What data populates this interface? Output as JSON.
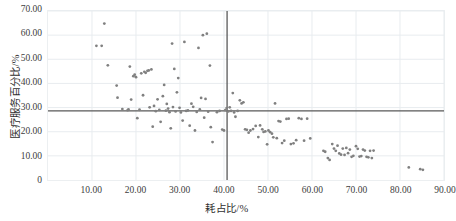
{
  "chart_data": {
    "type": "scatter",
    "title": "",
    "xlabel": "耗占比/%",
    "ylabel": "医疗服务百分比/%",
    "xlim": [
      0,
      90
    ],
    "ylim": [
      0,
      70
    ],
    "xticks": [
      "10.00",
      "20.00",
      "30.00",
      "40.00",
      "50.00",
      "60.00",
      "70.00",
      "80.00",
      "90.00"
    ],
    "xtick_values": [
      10,
      20,
      30,
      40,
      50,
      60,
      70,
      80,
      90
    ],
    "yticks": [
      "0",
      "10.00",
      "20.00",
      "30.00",
      "40.00",
      "50.00",
      "60.00",
      "70.00"
    ],
    "ytick_values": [
      0,
      10,
      20,
      30,
      40,
      50,
      60,
      70
    ],
    "grid": true,
    "legend": false,
    "point_color": "#808080",
    "reference_line_color": "#595959",
    "grid_color": "#e8ecef",
    "reference_lines": [
      {
        "orientation": "horizontal",
        "value": 28.6,
        "label": ""
      },
      {
        "orientation": "vertical",
        "value": 40.7,
        "label": ""
      }
    ],
    "points": [
      [
        11.0,
        55.6
      ],
      [
        12.2,
        55.6
      ],
      [
        12.8,
        64.8
      ],
      [
        13.6,
        47.5
      ],
      [
        15.6,
        39.1
      ],
      [
        15.8,
        34.1
      ],
      [
        16.9,
        29.4
      ],
      [
        18.1,
        28.9
      ],
      [
        18.3,
        29.2
      ],
      [
        18.6,
        47.0
      ],
      [
        18.9,
        33.3
      ],
      [
        19.4,
        43.0
      ],
      [
        19.7,
        43.6
      ],
      [
        20.0,
        42.6
      ],
      [
        20.3,
        25.6
      ],
      [
        20.8,
        29.1
      ],
      [
        21.2,
        44.2
      ],
      [
        21.6,
        35.1
      ],
      [
        21.9,
        44.8
      ],
      [
        22.2,
        44.4
      ],
      [
        22.6,
        45.2
      ],
      [
        22.9,
        45.4
      ],
      [
        23.1,
        30.1
      ],
      [
        23.5,
        45.8
      ],
      [
        23.8,
        22.1
      ],
      [
        24.1,
        30.7
      ],
      [
        24.5,
        28.5
      ],
      [
        24.9,
        33.4
      ],
      [
        25.3,
        29.0
      ],
      [
        25.6,
        24.1
      ],
      [
        26.1,
        34.7
      ],
      [
        26.4,
        39.4
      ],
      [
        26.8,
        28.7
      ],
      [
        27.0,
        31.5
      ],
      [
        27.3,
        29.6
      ],
      [
        27.6,
        28.1
      ],
      [
        27.9,
        21.4
      ],
      [
        28.2,
        56.5
      ],
      [
        28.4,
        30.2
      ],
      [
        28.7,
        46.0
      ],
      [
        29.0,
        28.4
      ],
      [
        29.3,
        36.3
      ],
      [
        29.6,
        42.2
      ],
      [
        29.9,
        29.9
      ],
      [
        30.2,
        28.0
      ],
      [
        30.6,
        24.6
      ],
      [
        31.0,
        57.2
      ],
      [
        31.4,
        28.6
      ],
      [
        31.8,
        28.8
      ],
      [
        32.2,
        22.5
      ],
      [
        32.6,
        31.6
      ],
      [
        33.0,
        30.3
      ],
      [
        33.4,
        20.5
      ],
      [
        33.8,
        28.2
      ],
      [
        34.2,
        54.7
      ],
      [
        34.5,
        29.2
      ],
      [
        34.8,
        34.0
      ],
      [
        35.2,
        60.0
      ],
      [
        35.5,
        25.8
      ],
      [
        35.8,
        33.6
      ],
      [
        36.1,
        60.6
      ],
      [
        36.4,
        28.3
      ],
      [
        36.8,
        47.4
      ],
      [
        37.0,
        21.9
      ],
      [
        37.4,
        15.7
      ],
      [
        38.4,
        28.1
      ],
      [
        39.0,
        28.6
      ],
      [
        39.6,
        20.9
      ],
      [
        40.0,
        20.5
      ],
      [
        40.3,
        28.9
      ],
      [
        40.6,
        29.8
      ],
      [
        41.0,
        28.4
      ],
      [
        41.3,
        30.1
      ],
      [
        41.6,
        28.6
      ],
      [
        42.0,
        36.0
      ],
      [
        42.3,
        28.0
      ],
      [
        42.6,
        26.2
      ],
      [
        43.1,
        28.6
      ],
      [
        43.6,
        33.0
      ],
      [
        44.0,
        31.7
      ],
      [
        44.4,
        32.2
      ],
      [
        44.8,
        21.0
      ],
      [
        45.2,
        20.8
      ],
      [
        45.6,
        19.6
      ],
      [
        46.0,
        20.5
      ],
      [
        46.6,
        21.1
      ],
      [
        47.2,
        22.4
      ],
      [
        47.8,
        17.8
      ],
      [
        48.2,
        22.6
      ],
      [
        48.7,
        21.0
      ],
      [
        49.0,
        19.9
      ],
      [
        49.4,
        20.1
      ],
      [
        49.8,
        14.8
      ],
      [
        50.1,
        20.5
      ],
      [
        50.5,
        19.8
      ],
      [
        50.9,
        19.2
      ],
      [
        51.2,
        17.7
      ],
      [
        51.6,
        31.7
      ],
      [
        52.0,
        17.3
      ],
      [
        52.4,
        24.4
      ],
      [
        52.8,
        24.2
      ],
      [
        53.2,
        15.3
      ],
      [
        53.7,
        16.3
      ],
      [
        54.2,
        25.3
      ],
      [
        54.7,
        25.4
      ],
      [
        55.2,
        14.9
      ],
      [
        55.8,
        15.2
      ],
      [
        56.4,
        16.5
      ],
      [
        57.0,
        25.6
      ],
      [
        57.6,
        25.3
      ],
      [
        58.2,
        16.3
      ],
      [
        58.9,
        25.4
      ],
      [
        59.6,
        17.2
      ],
      [
        62.6,
        12.1
      ],
      [
        63.0,
        11.7
      ],
      [
        63.6,
        9.1
      ],
      [
        64.0,
        8.3
      ],
      [
        64.6,
        14.9
      ],
      [
        65.0,
        13.0
      ],
      [
        65.4,
        12.1
      ],
      [
        65.8,
        14.2
      ],
      [
        66.2,
        11.0
      ],
      [
        66.6,
        10.5
      ],
      [
        67.0,
        13.0
      ],
      [
        67.4,
        10.4
      ],
      [
        67.8,
        13.3
      ],
      [
        68.2,
        11.1
      ],
      [
        68.6,
        12.6
      ],
      [
        69.0,
        9.6
      ],
      [
        69.4,
        10.0
      ],
      [
        70.0,
        14.0
      ],
      [
        70.4,
        12.9
      ],
      [
        70.8,
        9.7
      ],
      [
        71.2,
        9.9
      ],
      [
        71.6,
        12.6
      ],
      [
        72.0,
        12.2
      ],
      [
        72.4,
        9.6
      ],
      [
        72.8,
        9.4
      ],
      [
        73.2,
        12.1
      ],
      [
        73.6,
        9.1
      ],
      [
        74.0,
        12.2
      ],
      [
        82.0,
        5.2
      ],
      [
        84.6,
        4.5
      ],
      [
        85.2,
        4.2
      ]
    ]
  }
}
